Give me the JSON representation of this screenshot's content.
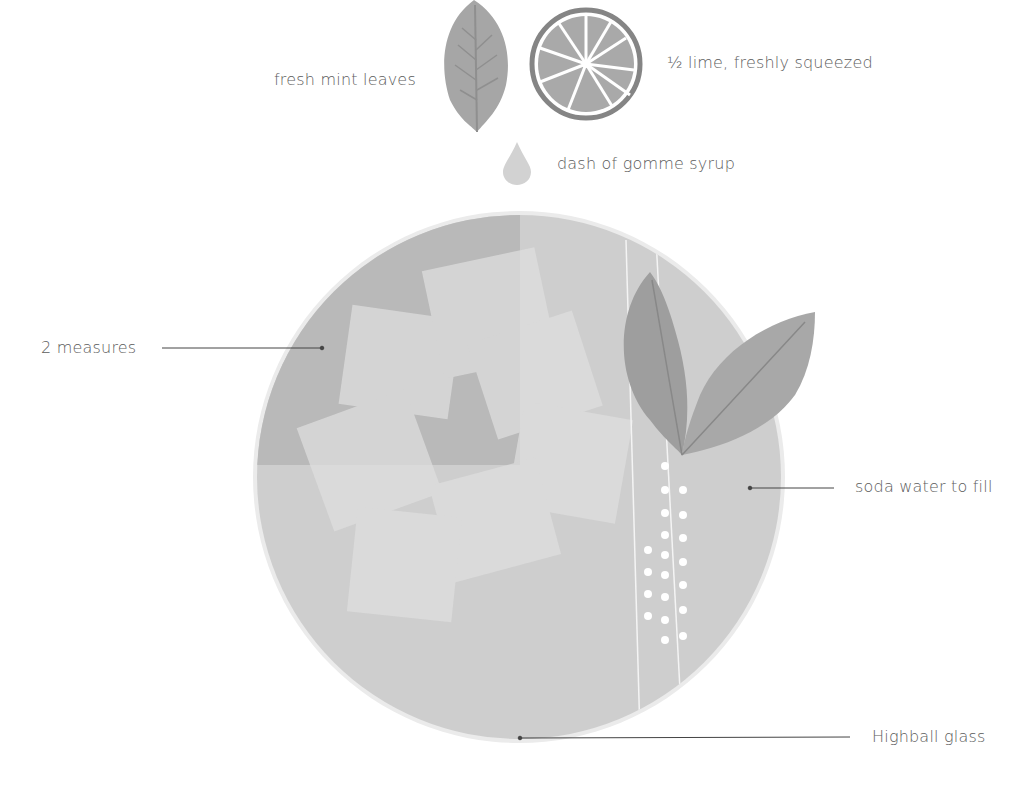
{
  "ingredients": {
    "mint": "fresh mint leaves",
    "lime": "½ lime, freshly squeezed",
    "syrup": "dash of gomme syrup"
  },
  "callouts": {
    "spirit": "2 measures",
    "soda": "soda water to fill",
    "glass": "Highball glass"
  },
  "colors": {
    "background": "#ffffff",
    "glass_rim": "#e6e6e6",
    "liquid_light": "#cfcfcf",
    "liquid_dark": "#b8b8b8",
    "leaf": "#a3a3a3",
    "lime_rind": "#8a8a8a",
    "text": "#5c5c5c"
  }
}
